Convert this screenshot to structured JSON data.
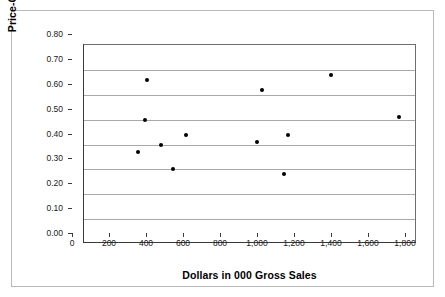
{
  "chart_data": {
    "type": "scatter",
    "title": "",
    "xlabel": "Dollars in 000 Gross Sales",
    "ylabel": "Price-Gross Ratio",
    "xlim": [
      0,
      1800
    ],
    "ylim": [
      0.0,
      0.8
    ],
    "grid": "horizontal",
    "legend": "none",
    "marker_color": "#000000",
    "gridline_color": "#a8a8a8",
    "axis_color": "#3a3a3a",
    "xticks": [
      0,
      200,
      400,
      600,
      800,
      1000,
      1200,
      1400,
      1600,
      1800
    ],
    "xtick_labels": [
      "0",
      "200",
      "400",
      "600",
      "800",
      "1,000",
      "1,200",
      "1,400",
      "1,600",
      "1,800"
    ],
    "yticks": [
      0.0,
      0.1,
      0.2,
      0.3,
      0.4,
      0.5,
      0.6,
      0.7,
      0.8
    ],
    "ytick_labels": [
      "0.00",
      "0.10",
      "0.20",
      "0.30",
      "0.40",
      "0.50",
      "0.60",
      "0.70",
      "0.80"
    ],
    "points": [
      {
        "x": 290,
        "y": 0.37
      },
      {
        "x": 330,
        "y": 0.5
      },
      {
        "x": 340,
        "y": 0.66
      },
      {
        "x": 415,
        "y": 0.4
      },
      {
        "x": 480,
        "y": 0.3
      },
      {
        "x": 550,
        "y": 0.44
      },
      {
        "x": 935,
        "y": 0.41
      },
      {
        "x": 960,
        "y": 0.62
      },
      {
        "x": 1080,
        "y": 0.28
      },
      {
        "x": 1100,
        "y": 0.44
      },
      {
        "x": 1335,
        "y": 0.68
      },
      {
        "x": 1700,
        "y": 0.51
      }
    ]
  }
}
